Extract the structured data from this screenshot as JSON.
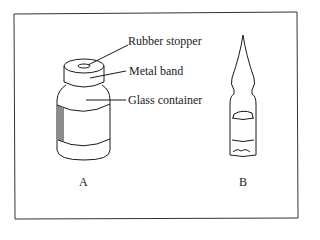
{
  "figure": {
    "vial": {
      "letter": "A",
      "labels": {
        "stopper": "Rubber stopper",
        "band": "Metal band",
        "container": "Glass container"
      }
    },
    "ampule": {
      "letter": "B"
    },
    "colors": {
      "ink": "#1a1a1a",
      "background": "#ffffff"
    }
  }
}
